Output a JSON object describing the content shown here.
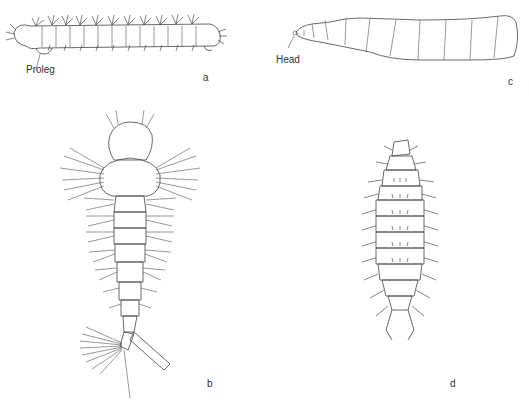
{
  "figure": {
    "panels": [
      {
        "id": "a",
        "label": "a",
        "annotation": "Proleg",
        "description": "hairy segmented larva, lateral view"
      },
      {
        "id": "b",
        "label": "b",
        "description": "mosquito-type larva with long setae, dorsal view"
      },
      {
        "id": "c",
        "label": "c",
        "annotation": "Head",
        "description": "smooth segmented maggot, lateral view"
      },
      {
        "id": "d",
        "label": "d",
        "description": "flattened segmented larva with lateral spines and terminal hooks, dorsal view"
      }
    ]
  }
}
